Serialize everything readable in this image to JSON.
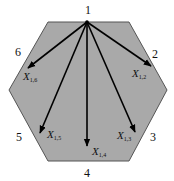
{
  "diagram": {
    "shape": "hexagon",
    "fill_color": "#a9a9a9",
    "edge_color": "#555555",
    "arrow_color": "#000000",
    "hexagon_points": [
      [
        48,
        22
      ],
      [
        129,
        22
      ],
      [
        167,
        90
      ],
      [
        129,
        161
      ],
      [
        48,
        161
      ],
      [
        9,
        90
      ]
    ],
    "origin": {
      "label": "1",
      "x": 87,
      "y": 22
    },
    "vertices": [
      {
        "id": "1",
        "label": "1",
        "x": 88,
        "y": 14
      },
      {
        "id": "2",
        "label": "2",
        "x": 155,
        "y": 58
      },
      {
        "id": "3",
        "label": "3",
        "x": 153,
        "y": 141
      },
      {
        "id": "4",
        "label": "4",
        "x": 87,
        "y": 177
      },
      {
        "id": "5",
        "label": "5",
        "x": 19,
        "y": 141
      },
      {
        "id": "6",
        "label": "6",
        "x": 18,
        "y": 56
      }
    ],
    "arrows": [
      {
        "to": "2",
        "x2": 151,
        "y2": 66,
        "label_main": "X",
        "label_sub": "1,2",
        "lx": 132,
        "ly": 77
      },
      {
        "to": "3",
        "x2": 135,
        "y2": 132,
        "label_main": "X",
        "label_sub": "1,3",
        "lx": 117,
        "ly": 139
      },
      {
        "to": "4",
        "x2": 87,
        "y2": 146,
        "label_main": "X",
        "label_sub": "1,4",
        "lx": 92,
        "ly": 155
      },
      {
        "to": "5",
        "x2": 40,
        "y2": 133,
        "label_main": "X",
        "label_sub": "1,5",
        "lx": 47,
        "ly": 138
      },
      {
        "to": "6",
        "x2": 28,
        "y2": 68,
        "label_main": "X",
        "label_sub": "1,6",
        "lx": 23,
        "ly": 80
      }
    ]
  }
}
